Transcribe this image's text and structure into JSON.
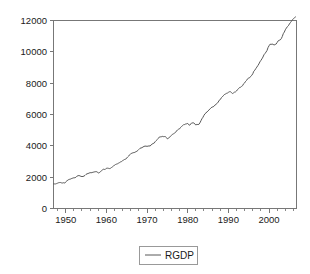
{
  "chart_data": {
    "type": "line",
    "title": "",
    "subtitle": "",
    "xlabel": "",
    "ylabel": "",
    "xlim": [
      1947.0,
      2006.75
    ],
    "ylim": [
      0,
      12000
    ],
    "grid": false,
    "legend_position": "bottom-center",
    "x_ticks_major": [
      "1950",
      "1960",
      "1970",
      "1980",
      "1990",
      "2000"
    ],
    "x_ticks_major_values": [
      1950,
      1960,
      1970,
      1980,
      1990,
      2000
    ],
    "x_tick_minor_step": 2,
    "y_ticks": [
      "0",
      "2000",
      "4000",
      "6000",
      "8000",
      "10000",
      "12000"
    ],
    "y_tick_values": [
      0,
      2000,
      4000,
      6000,
      8000,
      10000,
      12000
    ],
    "series": [
      {
        "name": "RGDP",
        "color": "#595959",
        "x": [
          1947.0,
          1947.25,
          1947.5,
          1947.75,
          1948.0,
          1948.25,
          1948.5,
          1948.75,
          1949.0,
          1949.25,
          1949.5,
          1949.75,
          1950.0,
          1950.25,
          1950.5,
          1950.75,
          1951.0,
          1951.25,
          1951.5,
          1951.75,
          1952.0,
          1952.25,
          1952.5,
          1952.75,
          1953.0,
          1953.25,
          1953.5,
          1953.75,
          1954.0,
          1954.25,
          1954.5,
          1954.75,
          1955.0,
          1955.25,
          1955.5,
          1955.75,
          1956.0,
          1956.25,
          1956.5,
          1956.75,
          1957.0,
          1957.25,
          1957.5,
          1957.75,
          1958.0,
          1958.25,
          1958.5,
          1958.75,
          1959.0,
          1959.25,
          1959.5,
          1959.75,
          1960.0,
          1960.25,
          1960.5,
          1960.75,
          1961.0,
          1961.25,
          1961.5,
          1961.75,
          1962.0,
          1962.25,
          1962.5,
          1962.75,
          1963.0,
          1963.25,
          1963.5,
          1963.75,
          1964.0,
          1964.25,
          1964.5,
          1964.75,
          1965.0,
          1965.25,
          1965.5,
          1965.75,
          1966.0,
          1966.25,
          1966.5,
          1966.75,
          1967.0,
          1967.25,
          1967.5,
          1967.75,
          1968.0,
          1968.25,
          1968.5,
          1968.75,
          1969.0,
          1969.25,
          1969.5,
          1969.75,
          1970.0,
          1970.25,
          1970.5,
          1970.75,
          1971.0,
          1971.25,
          1971.5,
          1971.75,
          1972.0,
          1972.25,
          1972.5,
          1972.75,
          1973.0,
          1973.25,
          1973.5,
          1973.75,
          1974.0,
          1974.25,
          1974.5,
          1974.75,
          1975.0,
          1975.25,
          1975.5,
          1975.75,
          1976.0,
          1976.25,
          1976.5,
          1976.75,
          1977.0,
          1977.25,
          1977.5,
          1977.75,
          1978.0,
          1978.25,
          1978.5,
          1978.75,
          1979.0,
          1979.25,
          1979.5,
          1979.75,
          1980.0,
          1980.25,
          1980.5,
          1980.75,
          1981.0,
          1981.25,
          1981.5,
          1981.75,
          1982.0,
          1982.25,
          1982.5,
          1982.75,
          1983.0,
          1983.25,
          1983.5,
          1983.75,
          1984.0,
          1984.25,
          1984.5,
          1984.75,
          1985.0,
          1985.25,
          1985.5,
          1985.75,
          1986.0,
          1986.25,
          1986.5,
          1986.75,
          1987.0,
          1987.25,
          1987.5,
          1987.75,
          1988.0,
          1988.25,
          1988.5,
          1988.75,
          1989.0,
          1989.25,
          1989.5,
          1989.75,
          1990.0,
          1990.25,
          1990.5,
          1990.75,
          1991.0,
          1991.25,
          1991.5,
          1991.75,
          1992.0,
          1992.25,
          1992.5,
          1992.75,
          1993.0,
          1993.25,
          1993.5,
          1993.75,
          1994.0,
          1994.25,
          1994.5,
          1994.75,
          1995.0,
          1995.25,
          1995.5,
          1995.75,
          1996.0,
          1996.25,
          1996.5,
          1996.75,
          1997.0,
          1997.25,
          1997.5,
          1997.75,
          1998.0,
          1998.25,
          1998.5,
          1998.75,
          1999.0,
          1999.25,
          1999.5,
          1999.75,
          2000.0,
          2000.25,
          2000.5,
          2000.75,
          2001.0,
          2001.25,
          2001.5,
          2001.75,
          2002.0,
          2002.25,
          2002.5,
          2002.75,
          2003.0,
          2003.25,
          2003.5,
          2003.75,
          2004.0,
          2004.25,
          2004.5,
          2004.75,
          2005.0,
          2005.25,
          2005.5,
          2005.75,
          2006.0,
          2006.25,
          2006.5
        ],
        "values": [
          1570,
          1568,
          1568,
          1590,
          1616,
          1645,
          1657,
          1658,
          1633,
          1628,
          1646,
          1620,
          1696,
          1747,
          1816,
          1845,
          1869,
          1885,
          1920,
          1940,
          1960,
          1965,
          1990,
          2060,
          2090,
          2104,
          2084,
          2051,
          2040,
          2043,
          2071,
          2113,
          2178,
          2215,
          2233,
          2261,
          2288,
          2280,
          2297,
          2315,
          2333,
          2345,
          2357,
          2327,
          2270,
          2286,
          2341,
          2398,
          2456,
          2505,
          2494,
          2498,
          2569,
          2575,
          2566,
          2548,
          2565,
          2613,
          2660,
          2705,
          2772,
          2809,
          2833,
          2856,
          2896,
          2932,
          2975,
          2999,
          3056,
          3092,
          3133,
          3148,
          3224,
          3293,
          3352,
          3430,
          3502,
          3524,
          3553,
          3570,
          3583,
          3625,
          3653,
          3704,
          3774,
          3839,
          3864,
          3879,
          3928,
          3960,
          3986,
          3977,
          3972,
          3977,
          4003,
          3982,
          4063,
          4112,
          4147,
          4174,
          4266,
          4334,
          4397,
          4470,
          4559,
          4573,
          4577,
          4605,
          4586,
          4592,
          4588,
          4532,
          4446,
          4473,
          4557,
          4593,
          4670,
          4739,
          4768,
          4810,
          4855,
          4948,
          5016,
          5062,
          5085,
          5178,
          5238,
          5287,
          5356,
          5359,
          5395,
          5407,
          5432,
          5346,
          5316,
          5398,
          5467,
          5460,
          5466,
          5396,
          5325,
          5373,
          5358,
          5369,
          5467,
          5600,
          5728,
          5824,
          5950,
          6048,
          6107,
          6161,
          6232,
          6292,
          6360,
          6430,
          6473,
          6490,
          6534,
          6614,
          6662,
          6712,
          6794,
          6909,
          6949,
          7063,
          7124,
          7196,
          7270,
          7303,
          7346,
          7365,
          7414,
          7453,
          7455,
          7401,
          7340,
          7376,
          7425,
          7444,
          7498,
          7592,
          7646,
          7724,
          7741,
          7794,
          7843,
          7966,
          8017,
          8121,
          8184,
          8287,
          8327,
          8351,
          8440,
          8500,
          8600,
          8760,
          8829,
          8932,
          9026,
          9123,
          9227,
          9358,
          9454,
          9552,
          9667,
          9812,
          9891,
          9985,
          10084,
          10270,
          10388,
          10487,
          10473,
          10499,
          10472,
          10438,
          10471,
          10497,
          10599,
          10704,
          10737,
          10762,
          10839,
          10975,
          11158,
          11261,
          11407,
          11512,
          11604,
          11664,
          11778,
          11865,
          11953,
          12044,
          12112,
          12181,
          12227
        ]
      }
    ],
    "legend": [
      {
        "label": "RGDP",
        "color": "#595959"
      }
    ]
  },
  "legend": {
    "label": "RGDP"
  },
  "axes": {
    "y_label_0": "0",
    "y_label_2000": "2000",
    "y_label_4000": "4000",
    "y_label_6000": "6000",
    "y_label_8000": "8000",
    "y_label_10000": "10000",
    "y_label_12000": "12000",
    "x_label_1950": "1950",
    "x_label_1960": "1960",
    "x_label_1970": "1970",
    "x_label_1980": "1980",
    "x_label_1990": "1990",
    "x_label_2000": "2000"
  },
  "colors": {
    "series": "#595959",
    "axis": "#777777",
    "text": "#1a1a1a",
    "background": "#ffffff",
    "legend_border": "#999999"
  }
}
